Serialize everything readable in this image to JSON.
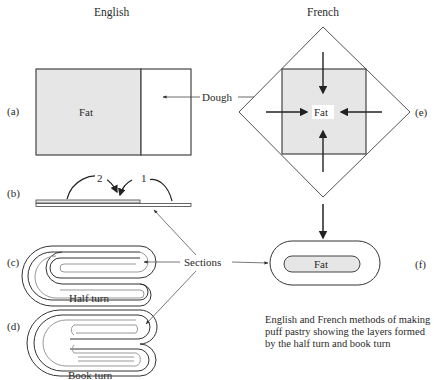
{
  "headers": {
    "english": "English",
    "french": "French"
  },
  "panel_labels": {
    "a": "(a)",
    "b": "(b)",
    "c": "(c)",
    "d": "(d)",
    "e": "(e)",
    "f": "(f)"
  },
  "labels": {
    "fat_a": "Fat",
    "dough": "Dough",
    "fat_e": "Fat",
    "fat_f": "Fat",
    "sections": "Sections",
    "fold_2": "2",
    "fold_1": "1",
    "half_turn": "Half turn",
    "book_turn": "Book turn"
  },
  "caption": "English and French methods of making puff pastry showing the layers formed by the half turn and book turn",
  "colors": {
    "fat_fill": "#e6e6e6",
    "line": "#3a3a3a",
    "background": "#ffffff"
  }
}
